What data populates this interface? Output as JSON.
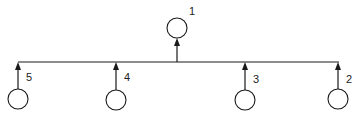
{
  "diagram": {
    "type": "bus-tree",
    "colors": {
      "line": "#1a1a1a",
      "background": "#ffffff",
      "label": "#222222"
    },
    "bus": {
      "y": 62,
      "x1": 18,
      "x2": 339
    },
    "top_node": {
      "id": "node-1",
      "label": "1",
      "cx": 177,
      "cy": 28,
      "r": 10,
      "direction": "arrow from bus up to node"
    },
    "bottom_nodes": [
      {
        "id": "node-5",
        "label": "5",
        "cx": 18,
        "cy": 99,
        "r": 10,
        "direction": "arrow from node up to bus"
      },
      {
        "id": "node-4",
        "label": "4",
        "cx": 116,
        "cy": 100,
        "r": 10,
        "direction": "arrow from node up to bus"
      },
      {
        "id": "node-3",
        "label": "3",
        "cx": 245,
        "cy": 100,
        "r": 10,
        "direction": "arrow from node up to bus"
      },
      {
        "id": "node-2",
        "label": "2",
        "cx": 338,
        "cy": 99,
        "r": 10,
        "direction": "arrow from node up to bus"
      }
    ]
  }
}
